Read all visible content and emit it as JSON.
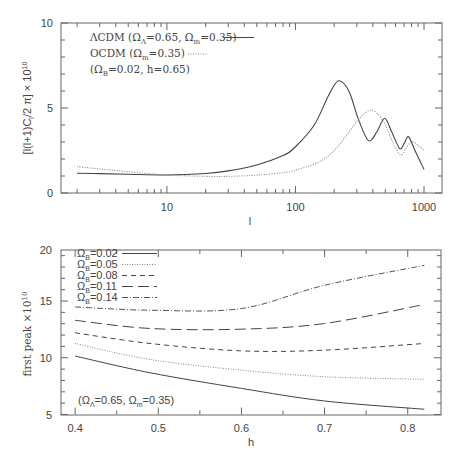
{
  "chart_data": [
    {
      "type": "line",
      "panel": "top",
      "title": "",
      "xlabel": "l",
      "ylabel": "[l(l+1)C_l/2 π] × 10^10",
      "xscale": "log",
      "xlim": [
        1.5,
        1380
      ],
      "ylim": [
        0,
        10
      ],
      "xticks": [
        10,
        100,
        1000
      ],
      "xtick_labels": [
        "10",
        "100",
        "1000"
      ],
      "yticks": [
        0,
        5,
        10
      ],
      "ytick_labels": [
        "0",
        "5",
        "10"
      ],
      "grid": false,
      "legend_position": "upper left",
      "legend": [
        {
          "label": "ΛCDM (Ω_Λ=0.65, Ω_m=0.35)",
          "style": "solid"
        },
        {
          "label": "OCDM (Ω_m=0.35)",
          "style": "dotted"
        }
      ],
      "annotations": [
        "(Ω_B=0.02, h=0.65)"
      ],
      "series": [
        {
          "name": "ΛCDM (Ω_Λ=0.65, Ω_m=0.35)",
          "style": "solid",
          "x": [
            2,
            3,
            5,
            10,
            20,
            30,
            50,
            80,
            100,
            140,
            180,
            216,
            260,
            310,
            370,
            430,
            493,
            560,
            645,
            700,
            758,
            850,
            1000
          ],
          "y": [
            1.16,
            1.14,
            1.1,
            1.06,
            1.15,
            1.3,
            1.65,
            2.2,
            2.72,
            4.0,
            5.7,
            6.6,
            6.0,
            4.3,
            3.08,
            3.6,
            4.4,
            3.6,
            2.63,
            2.9,
            3.31,
            2.5,
            1.39
          ]
        },
        {
          "name": "OCDM (Ω_m=0.35)",
          "style": "dotted",
          "x": [
            2,
            3,
            5,
            10,
            20,
            30,
            50,
            80,
            100,
            150,
            200,
            250,
            300,
            370,
            430,
            500,
            570,
            655,
            720,
            800,
            900,
            1000
          ],
          "y": [
            1.55,
            1.42,
            1.25,
            1.06,
            0.98,
            0.98,
            1.05,
            1.2,
            1.35,
            1.8,
            2.5,
            3.4,
            4.2,
            4.84,
            4.7,
            4.0,
            3.0,
            2.24,
            2.6,
            3.02,
            2.8,
            2.53
          ]
        }
      ]
    },
    {
      "type": "line",
      "panel": "bottom",
      "title": "",
      "xlabel": "h",
      "ylabel": "first peak ×10^10",
      "xlim": [
        0.383,
        0.84
      ],
      "ylim": [
        5,
        20
      ],
      "xticks": [
        0.4,
        0.5,
        0.6,
        0.7,
        0.8
      ],
      "xtick_labels": [
        "0.4",
        "0.5",
        "0.6",
        "0.7",
        "0.8"
      ],
      "yticks": [
        5,
        10,
        15,
        20
      ],
      "ytick_labels": [
        "5",
        "10",
        "15",
        "20"
      ],
      "grid": false,
      "legend_position": "upper left",
      "legend": [
        {
          "label": "Ω_B=0.02",
          "style": "solid"
        },
        {
          "label": "Ω_B=0.05",
          "style": "dotted"
        },
        {
          "label": "Ω_B=0.08",
          "style": "dashed"
        },
        {
          "label": "Ω_B=0.11",
          "style": "long-dashed"
        },
        {
          "label": "Ω_B=0.14",
          "style": "dash-dot"
        }
      ],
      "annotations": [
        "(Ω_Λ=0.65, Ω_m=0.35)"
      ],
      "series": [
        {
          "name": "Ω_B=0.02",
          "style": "solid",
          "x": [
            0.4,
            0.49,
            0.6,
            0.7,
            0.82
          ],
          "y": [
            10.15,
            8.68,
            7.3,
            6.19,
            5.46
          ]
        },
        {
          "name": "Ω_B=0.05",
          "style": "dotted",
          "x": [
            0.4,
            0.49,
            0.6,
            0.7,
            0.82
          ],
          "y": [
            11.26,
            9.85,
            8.91,
            8.33,
            8.1
          ]
        },
        {
          "name": "Ω_B=0.08",
          "style": "dashed",
          "x": [
            0.4,
            0.49,
            0.6,
            0.7,
            0.82
          ],
          "y": [
            12.2,
            11.26,
            10.61,
            10.67,
            11.26
          ]
        },
        {
          "name": "Ω_B=0.11",
          "style": "long-dashed",
          "x": [
            0.4,
            0.49,
            0.6,
            0.7,
            0.82
          ],
          "y": [
            13.3,
            12.58,
            12.52,
            13.02,
            14.7
          ]
        },
        {
          "name": "Ω_B=0.14",
          "style": "dash-dot",
          "x": [
            0.4,
            0.49,
            0.6,
            0.7,
            0.82
          ],
          "y": [
            14.48,
            14.19,
            14.34,
            16.39,
            18.15
          ]
        }
      ]
    }
  ],
  "top_panel": {
    "ylabel": "[l(l+1)C",
    "ylabel_sub": "l",
    "ylabel_rest": "/2 π] × 10",
    "ylabel_sup": "10",
    "xlabel": "l",
    "legend": [
      {
        "prefix": "ΛCDM (Ω",
        "sub1": "Λ",
        "mid": "=0.65, Ω",
        "sub2": "m",
        "suffix": "=0.35)"
      },
      {
        "prefix": "OCDM (Ω",
        "sub1": "m",
        "suffix": "=0.35)"
      }
    ],
    "annotation": {
      "prefix": "(Ω",
      "sub": "B",
      "suffix": "=0.02, h=0.65)"
    }
  },
  "bottom_panel": {
    "ylabel": "first peak ×10",
    "ylabel_sup": "10",
    "xlabel": "h",
    "legend": [
      {
        "prefix": "Ω",
        "sub": "B",
        "suffix": "=0.02"
      },
      {
        "prefix": "Ω",
        "sub": "B",
        "suffix": "=0.05"
      },
      {
        "prefix": "Ω",
        "sub": "B",
        "suffix": "=0.08"
      },
      {
        "prefix": "Ω",
        "sub": "B",
        "suffix": "=0.11"
      },
      {
        "prefix": "Ω",
        "sub": "B",
        "suffix": "=0.14"
      }
    ],
    "annotation": {
      "prefix": "(Ω",
      "sub1": "Λ",
      "mid": "=0.65, Ω",
      "sub2": "m",
      "suffix": "=0.35)"
    }
  },
  "colors": {
    "axis": "#666666",
    "line": "#444444",
    "text": "#444444"
  }
}
